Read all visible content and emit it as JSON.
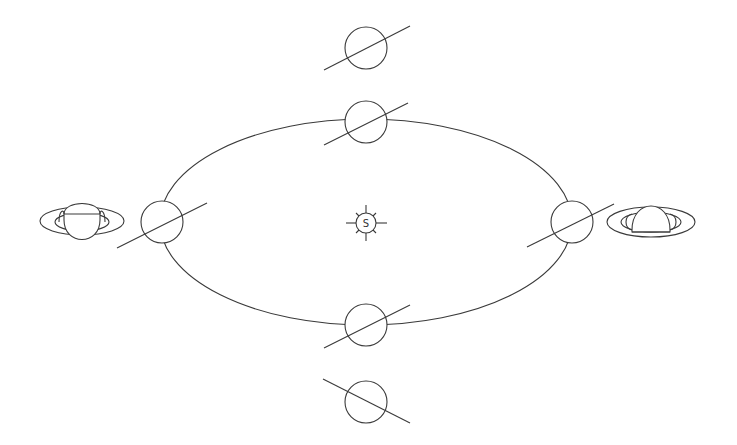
{
  "diagram": {
    "title": "",
    "sun": {
      "label": "S",
      "cx": 366,
      "cy": 223
    },
    "orbit": {
      "cx": 366,
      "cy": 222,
      "rx": 206,
      "ry": 103
    },
    "planets": [
      {
        "name": "top-outer",
        "cx": 366,
        "cy": 48,
        "r": 21,
        "axis": "tilted-up-right"
      },
      {
        "name": "top-orbit",
        "cx": 366,
        "cy": 122,
        "r": 21,
        "axis": "tilted-up-right"
      },
      {
        "name": "left-orbit",
        "cx": 162,
        "cy": 222,
        "r": 21,
        "axis": "tilted-up-right"
      },
      {
        "name": "right-orbit",
        "cx": 572,
        "cy": 222,
        "r": 21,
        "axis": "tilted-up-right"
      },
      {
        "name": "bottom-orbit",
        "cx": 366,
        "cy": 325,
        "r": 21,
        "axis": "tilted-up-right"
      },
      {
        "name": "bottom-outer",
        "cx": 366,
        "cy": 402,
        "r": 21,
        "axis": "tilted-down-right"
      }
    ],
    "saturn_views": [
      {
        "name": "left-view",
        "cx": 82,
        "cy": 221,
        "view": "south-pole-visible"
      },
      {
        "name": "right-view",
        "cx": 651,
        "cy": 222,
        "view": "north-pole-visible"
      }
    ],
    "colors": {
      "line": "#3a3a3a",
      "background": "#ffffff"
    }
  }
}
